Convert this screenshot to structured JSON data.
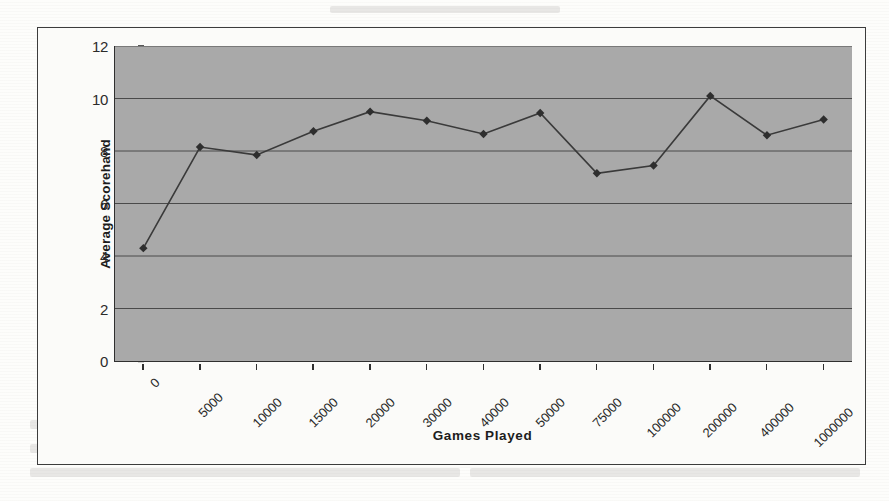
{
  "figure": {
    "background_color": "#fbfbf9",
    "plot_background_color": "#a9a9a9",
    "border_color": "#3c3c3c",
    "series_color": "#3a3a3a"
  },
  "chart_data": {
    "type": "line",
    "title": "",
    "xlabel": "Games Played",
    "ylabel": "Average Scorehand",
    "categories": [
      "0",
      "5000",
      "10000",
      "15000",
      "20000",
      "30000",
      "40000",
      "50000",
      "75000",
      "100000",
      "200000",
      "400000",
      "1000000"
    ],
    "values": [
      4.3,
      8.15,
      7.85,
      8.75,
      9.5,
      9.15,
      8.65,
      9.45,
      7.15,
      7.45,
      10.1,
      8.6,
      9.2
    ],
    "series": [
      {
        "name": "Average Score/hand",
        "values": [
          4.3,
          8.15,
          7.85,
          8.75,
          9.5,
          9.15,
          8.65,
          9.45,
          7.15,
          7.45,
          10.1,
          8.6,
          9.2
        ]
      }
    ],
    "ylim": [
      0,
      12
    ],
    "yticks": [
      0,
      2,
      4,
      6,
      8,
      10,
      12
    ],
    "ytick_labels": [
      "0",
      "2",
      "4",
      "6",
      "8",
      "10",
      "12"
    ],
    "grid": "horizontal",
    "legend": "none",
    "marker": "diamond",
    "xtick_label_rotation": -45
  },
  "scan_artifacts": {
    "ghost_text_visible": true
  }
}
